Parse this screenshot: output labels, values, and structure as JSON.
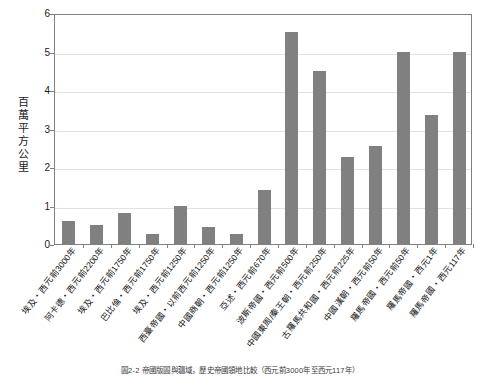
{
  "chart_data": {
    "type": "bar",
    "title": "",
    "xlabel": "",
    "ylabel": "百萬平方公里",
    "ylim": [
      0,
      6
    ],
    "yticks": [
      0,
      1,
      2,
      3,
      4,
      5,
      6
    ],
    "grid": true,
    "legend": "none",
    "bar_color": "#808080",
    "categories": [
      "埃及・西元前3000年",
      "阿卡德・西元前2200年",
      "埃及・西元前1750年",
      "巴比倫・西元前1750年",
      "埃及・西元前1250年",
      "西臺帝國・以前西元前1250年",
      "中國商朝・西元前1250年",
      "亞述・西元前670年",
      "波斯帝國・西元前500年",
      "中國東周/秦王朝・西元前250年",
      "古羅馬共和國・西元前225年",
      "中國漢朝・西元前50年",
      "羅馬帝國・西元前50年",
      "羅馬帝國・西元1年",
      "羅馬帝國・西元117年"
    ],
    "values": [
      0.6,
      0.5,
      0.8,
      0.25,
      1.0,
      0.45,
      0.25,
      1.4,
      5.5,
      4.5,
      2.25,
      2.55,
      5.0,
      3.35,
      5.0
    ],
    "caption": "圖2-2 帝國版圖與疆域，歷史帝國領地比較（西元前3000年至西元117年）"
  }
}
